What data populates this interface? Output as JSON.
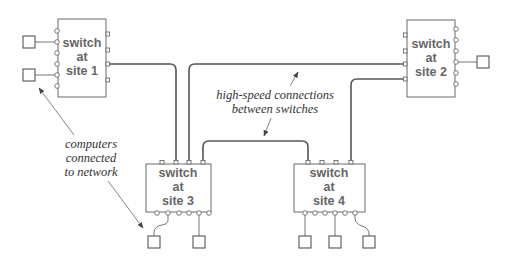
{
  "diagram": {
    "switches": [
      {
        "id": "site1",
        "lines": [
          "switch",
          "at",
          "site 1"
        ]
      },
      {
        "id": "site2",
        "lines": [
          "switch",
          "at",
          "site 2"
        ]
      },
      {
        "id": "site3",
        "lines": [
          "switch",
          "at",
          "site 3"
        ]
      },
      {
        "id": "site4",
        "lines": [
          "switch",
          "at",
          "site 4"
        ]
      }
    ],
    "annotations": {
      "high_speed": [
        "high-speed connections",
        "between switches"
      ],
      "computers": [
        "computers",
        "connected",
        "to network"
      ]
    },
    "computer_count": 7,
    "colors": {
      "box_stroke": "#6a6a6a",
      "wire": "#555555",
      "label_text": "#666666",
      "annotation_text": "#333333",
      "background": "#ffffff"
    }
  }
}
